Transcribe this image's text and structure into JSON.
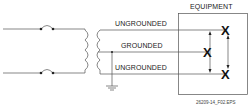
{
  "diagram": {
    "equipment_label": "EQUIPMENT",
    "wires": [
      {
        "label": "UNGROUNDED",
        "role": "line-1"
      },
      {
        "label": "GROUNDED",
        "role": "neutral"
      },
      {
        "label": "UNGROUNDED",
        "role": "line-2"
      }
    ],
    "terminal_marker": "X",
    "figure_id": "26209-14_F02.EPS"
  }
}
